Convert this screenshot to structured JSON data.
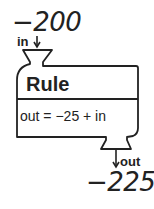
{
  "machine": {
    "input_value": "−200",
    "input_label": "in",
    "title": "Rule",
    "formula": "out = −25 + in",
    "output_label": "out",
    "output_value": "−225"
  },
  "colors": {
    "stroke": "#222222",
    "background": "#ffffff"
  }
}
